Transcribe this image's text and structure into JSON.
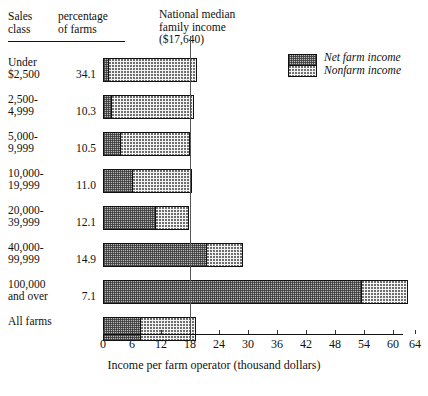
{
  "header": {
    "col_sales_class": "Sales\nclass",
    "col_sales_class_l1": "Sales",
    "col_sales_class_l2": "class",
    "col_percentage_l1": "percentage",
    "col_percentage_l2": "of farms",
    "median_title_l1": "National median",
    "median_title_l2": "family income",
    "median_title_l3": "($17,640)"
  },
  "legend": {
    "items": [
      {
        "label": "Net farm income",
        "key": "net",
        "color": "#b9b9b9"
      },
      {
        "label": "Nonfarm income",
        "key": "nonfarm",
        "color": "#f4f4f4"
      }
    ]
  },
  "axis": {
    "ticks": [
      0,
      6,
      12,
      18,
      24,
      30,
      36,
      42,
      48,
      54,
      60,
      64
    ],
    "tick_labels": [
      "0",
      "6",
      "12",
      "18",
      "24",
      "30",
      "36",
      "42",
      "48",
      "54",
      "60",
      "64"
    ],
    "xlabel": "Income per farm operator (thousand dollars)",
    "xmin": 0,
    "xmax": 64
  },
  "median_reference": {
    "label": "National median family income ($17,640)",
    "value": 17.64
  },
  "chart_data": {
    "type": "bar",
    "orientation": "horizontal",
    "stacked": true,
    "title": "",
    "xlabel": "Income per farm operator (thousand dollars)",
    "ylabel": "",
    "xlim": [
      0,
      64
    ],
    "grid": false,
    "legend_position": "top-right",
    "categories": [
      "Under $2,500",
      "2,500-4,999",
      "5,000-9,999",
      "10,000-19,999",
      "20,000-39,999",
      "40,000-99,999",
      "100,000 and over",
      "All farms"
    ],
    "series": [
      {
        "name": "Net farm income",
        "values": [
          0.8,
          1.4,
          3.4,
          5.8,
          10.6,
          21.2,
          53.1,
          7.4
        ]
      },
      {
        "name": "Nonfarm income",
        "values": [
          18.7,
          17.5,
          14.5,
          12.6,
          7.1,
          7.7,
          9.6,
          11.9
        ]
      }
    ],
    "totals": [
      19.5,
      18.9,
      17.9,
      18.4,
      17.7,
      28.9,
      62.7,
      19.3
    ],
    "annotations": [
      {
        "type": "vline",
        "value": 17.64,
        "label": "National median family income ($17,640)"
      }
    ]
  },
  "rows": [
    {
      "label_l1": "Under",
      "label_l2": "$2,500",
      "pct": "34.1",
      "net": 0.8,
      "nonfarm": 18.7
    },
    {
      "label_l1": "2,500-",
      "label_l2": "4,999",
      "pct": "10.3",
      "net": 1.4,
      "nonfarm": 17.5
    },
    {
      "label_l1": "5,000-",
      "label_l2": "9,999",
      "pct": "10.5",
      "net": 3.4,
      "nonfarm": 14.5
    },
    {
      "label_l1": "10,000-",
      "label_l2": "19,999",
      "pct": "11.0",
      "net": 5.8,
      "nonfarm": 12.6
    },
    {
      "label_l1": "20,000-",
      "label_l2": "39,999",
      "pct": "12.1",
      "net": 10.6,
      "nonfarm": 7.1
    },
    {
      "label_l1": "40,000-",
      "label_l2": "99,999",
      "pct": "14.9",
      "net": 21.2,
      "nonfarm": 7.7
    },
    {
      "label_l1": "100,000",
      "label_l2": "and over",
      "pct": "7.1",
      "net": 53.1,
      "nonfarm": 9.6
    },
    {
      "label_l1": "All farms",
      "label_l2": "",
      "pct": "",
      "net": 7.4,
      "nonfarm": 11.9
    }
  ]
}
